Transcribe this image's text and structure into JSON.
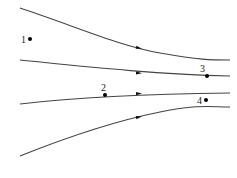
{
  "diagram": {
    "type": "streamlines",
    "line_color": "#444444",
    "streamlines": [
      {
        "id": "top",
        "path": "M20,8 C80,28 120,46 160,53 S210,60 230,60",
        "arrow": {
          "x": 139,
          "y": 48,
          "angle": 14
        }
      },
      {
        "id": "upper-middle",
        "path": "M20,60 C80,66 150,74 230,76",
        "arrow": {
          "x": 139,
          "y": 73,
          "angle": 3
        }
      },
      {
        "id": "lower-middle",
        "path": "M20,104 C70,98 130,94 230,93",
        "arrow": {
          "x": 139,
          "y": 93.5,
          "angle": -1
        }
      },
      {
        "id": "bottom",
        "path": "M20,156 C70,136 120,120 160,112 S210,107 230,107",
        "arrow": {
          "x": 139,
          "y": 117,
          "angle": -11
        }
      }
    ],
    "points": [
      {
        "label": "1",
        "x": 30,
        "y": 39,
        "label_x": 21,
        "label_y": 43
      },
      {
        "label": "2",
        "x": 105,
        "y": 95,
        "label_x": 101,
        "label_y": 91
      },
      {
        "label": "3",
        "x": 207,
        "y": 76,
        "label_x": 200,
        "label_y": 72
      },
      {
        "label": "4",
        "x": 206,
        "y": 100,
        "label_x": 197,
        "label_y": 104
      }
    ]
  }
}
